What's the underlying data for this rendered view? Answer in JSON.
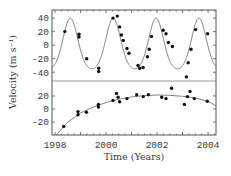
{
  "chart_data": [
    {
      "panel": "top",
      "type": "scatter",
      "title": "",
      "xlabel": "Time (Years)",
      "ylabel": "Velocity (m s⁻¹)",
      "xlim": [
        1997.88,
        2004.31
      ],
      "ylim": [
        -53,
        52
      ],
      "yticks": [
        40,
        20,
        0,
        -20,
        -40
      ],
      "ytick_labels": [
        "40",
        "20",
        "0",
        "-20",
        "-40"
      ],
      "grid": false,
      "legend": null,
      "fit_curve": {
        "type": "keplerian",
        "period_years": 1.68,
        "max": 40,
        "min": -35,
        "first_peak_year": 1998.6,
        "eccentricity_shape": 0.35
      },
      "points": [
        {
          "x": 1998.38,
          "y": 20
        },
        {
          "x": 1998.94,
          "y": 16
        },
        {
          "x": 1998.94,
          "y": 12
        },
        {
          "x": 1999.24,
          "y": -20
        },
        {
          "x": 1999.71,
          "y": -34
        },
        {
          "x": 1999.71,
          "y": -39
        },
        {
          "x": 2000.27,
          "y": 40
        },
        {
          "x": 2000.44,
          "y": 43
        },
        {
          "x": 2000.53,
          "y": 27
        },
        {
          "x": 2000.6,
          "y": 15
        },
        {
          "x": 2000.67,
          "y": 7
        },
        {
          "x": 2000.82,
          "y": -5
        },
        {
          "x": 2000.9,
          "y": -12
        },
        {
          "x": 2001.25,
          "y": -30
        },
        {
          "x": 2001.32,
          "y": -34
        },
        {
          "x": 2001.45,
          "y": -33
        },
        {
          "x": 2001.62,
          "y": -17
        },
        {
          "x": 2001.69,
          "y": -6
        },
        {
          "x": 2001.78,
          "y": 13
        },
        {
          "x": 2002.24,
          "y": 22
        },
        {
          "x": 2002.35,
          "y": 17
        },
        {
          "x": 2002.44,
          "y": 4
        },
        {
          "x": 2002.6,
          "y": -2
        },
        {
          "x": 2003.15,
          "y": -47
        },
        {
          "x": 2003.22,
          "y": -26
        },
        {
          "x": 2003.33,
          "y": -6
        },
        {
          "x": 2003.51,
          "y": 23
        },
        {
          "x": 2003.98,
          "y": 17
        }
      ]
    },
    {
      "panel": "bottom",
      "type": "scatter",
      "title": "",
      "xlabel": "Time (Years)",
      "ylabel": "Velocity (m s⁻¹)",
      "xlim": [
        1997.88,
        2004.31
      ],
      "ylim": [
        -40,
        43
      ],
      "xticks": [
        1998,
        2000,
        2002,
        2004
      ],
      "xtick_labels": [
        "1998",
        "2000",
        "2002",
        "2004"
      ],
      "yticks": [
        20,
        0,
        -20
      ],
      "ytick_labels": [
        "20",
        "0",
        "-20"
      ],
      "grid": false,
      "legend": null,
      "fit_curve": {
        "type": "trend",
        "x": [
          1998.05,
          1998.5,
          1999.0,
          1999.5,
          2000.0,
          2000.5,
          2001.0,
          2001.5,
          2002.0,
          2002.5,
          2003.0,
          2003.5,
          2004.0,
          2004.31
        ],
        "y": [
          -40,
          -20,
          -6,
          3,
          10,
          15,
          18.5,
          20.5,
          21.5,
          21,
          19.5,
          17,
          11.5,
          5
        ]
      },
      "points": [
        {
          "x": 1998.34,
          "y": -27
        },
        {
          "x": 1998.9,
          "y": -4
        },
        {
          "x": 1998.9,
          "y": -9
        },
        {
          "x": 1999.23,
          "y": -5
        },
        {
          "x": 1999.7,
          "y": 7
        },
        {
          "x": 1999.7,
          "y": 3
        },
        {
          "x": 2000.27,
          "y": 13
        },
        {
          "x": 2000.41,
          "y": 24
        },
        {
          "x": 2000.47,
          "y": 18
        },
        {
          "x": 2000.53,
          "y": 11
        },
        {
          "x": 2000.82,
          "y": 16
        },
        {
          "x": 2001.2,
          "y": 22
        },
        {
          "x": 2001.46,
          "y": 19
        },
        {
          "x": 2001.66,
          "y": 22
        },
        {
          "x": 2002.18,
          "y": 18
        },
        {
          "x": 2002.35,
          "y": 16
        },
        {
          "x": 2002.57,
          "y": 32
        },
        {
          "x": 2003.07,
          "y": 7
        },
        {
          "x": 2003.19,
          "y": 19
        },
        {
          "x": 2003.29,
          "y": 27
        },
        {
          "x": 2003.46,
          "y": 16
        },
        {
          "x": 2003.97,
          "y": 12
        }
      ]
    }
  ],
  "labels": {
    "xlabel": "Time (Years)",
    "ylabel": "Velocity (m s⁻¹)"
  },
  "colors": {
    "points": "#111111",
    "curve": "#777777",
    "frame": "#555555",
    "text": "#3a3a3a"
  }
}
